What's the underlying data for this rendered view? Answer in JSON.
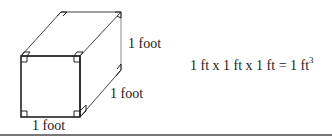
{
  "diagram": {
    "type": "cube-volume",
    "labels": {
      "height": "1 foot",
      "depth": "1 foot",
      "width": "1 foot"
    },
    "formula": {
      "text": "1 ft x 1 ft x 1 ft = 1 ft",
      "exponent": "3"
    },
    "colors": {
      "stroke": "#222222",
      "back_stroke": "#888888",
      "rule": "#777777"
    }
  }
}
